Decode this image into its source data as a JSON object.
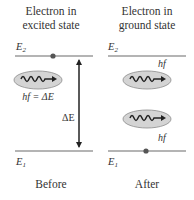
{
  "diagram": {
    "left_panel": {
      "title_line1": "Electron in",
      "title_line2": "excited state",
      "upper_level_label": "E",
      "upper_level_sub": "2",
      "lower_level_label": "E",
      "lower_level_sub": "1",
      "photon_label": "hf = ΔE",
      "energy_gap_label": "ΔE",
      "caption": "Before"
    },
    "right_panel": {
      "title_line1": "Electron in",
      "title_line2": "ground state",
      "upper_level_label": "E",
      "upper_level_sub": "2",
      "lower_level_label": "E",
      "lower_level_sub": "1",
      "photon_top_label": "hf",
      "photon_bottom_label": "hf",
      "caption": "After"
    },
    "colors": {
      "line": "#6b6b6b",
      "ellipse_fill": "#d4d4d4",
      "ellipse_stroke": "#8a8a8a",
      "dot": "#555555",
      "wave": "#222222",
      "text": "#333333"
    }
  }
}
